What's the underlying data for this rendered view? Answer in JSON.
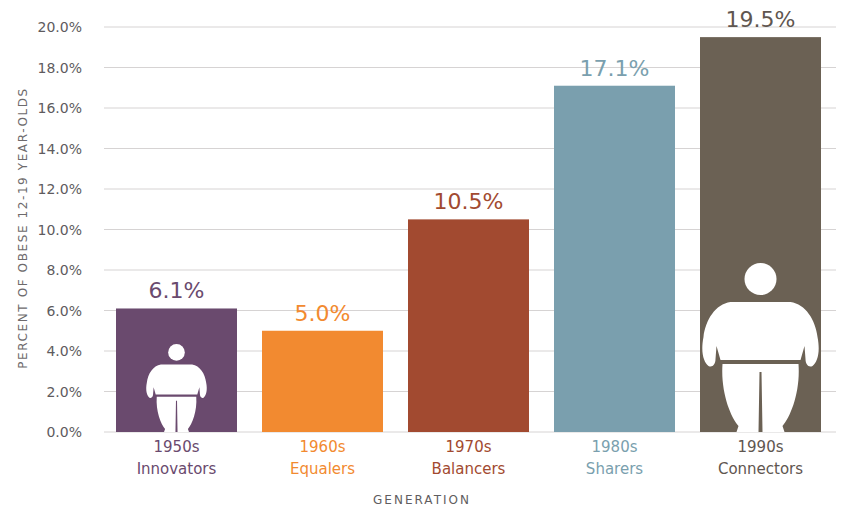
{
  "chart_data": {
    "type": "bar",
    "title": "",
    "xlabel": "GENERATION",
    "ylabel": "PERCENT OF OBESE 12-19 YEAR-OLDS",
    "ylim": [
      0,
      20
    ],
    "yticks": [
      "0.0%",
      "2.0%",
      "4.0%",
      "6.0%",
      "8.0%",
      "10.0%",
      "12.0%",
      "14.0%",
      "16.0%",
      "18.0%",
      "20.0%"
    ],
    "grid": true,
    "categories": [
      "1950s Innovators",
      "1960s Equalers",
      "1970s Balancers",
      "1980s Sharers",
      "1990s Connectors"
    ],
    "decades": [
      "1950s",
      "1960s",
      "1970s",
      "1980s",
      "1990s"
    ],
    "generations": [
      "Innovators",
      "Equalers",
      "Balancers",
      "Sharers",
      "Connectors"
    ],
    "values": [
      6.1,
      5.0,
      10.5,
      17.1,
      19.5
    ],
    "value_labels": [
      "6.1%",
      "5.0%",
      "10.5%",
      "17.1%",
      "19.5%"
    ],
    "colors": [
      "#6a4a6e",
      "#f28a30",
      "#a24a30",
      "#7a9fae",
      "#6b6154"
    ],
    "label_colors": [
      "#6a4a6e",
      "#f28a30",
      "#a24a30",
      "#7a9fae",
      "#5f5650"
    ],
    "icons": [
      "person-small-icon",
      "",
      "",
      "",
      "person-large-icon"
    ]
  }
}
